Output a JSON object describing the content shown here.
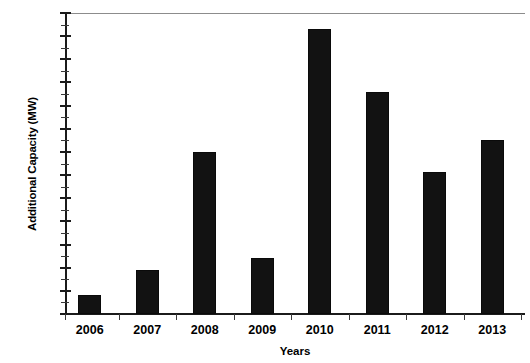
{
  "chart_data": {
    "type": "bar",
    "title": "",
    "subtitle": "",
    "xlabel": "Years",
    "ylabel": "Additional Capacity (MW)",
    "categories": [
      "2006",
      "2007",
      "2008",
      "2009",
      "2010",
      "2011",
      "2012",
      "2013"
    ],
    "values": [
      40,
      95,
      350,
      120,
      615,
      480,
      307,
      375
    ],
    "series": [
      {
        "name": "Additional Capacity",
        "values": [
          40,
          95,
          350,
          120,
          615,
          480,
          307,
          375
        ],
        "color": "#121212"
      }
    ],
    "ylim": [
      0,
      650
    ],
    "y_major_step": 50,
    "y_minor_step": 25,
    "y_tick_labels": [
      "0",
      "50",
      "100",
      "150",
      "200",
      "250",
      "300",
      "350",
      "400",
      "450",
      "500",
      "550",
      "600",
      "650"
    ],
    "y_tick_values": [
      0,
      50,
      100,
      150,
      200,
      250,
      300,
      350,
      400,
      450,
      500,
      550,
      600,
      650
    ],
    "grid": "top-only",
    "legend": "none",
    "legend_position": "",
    "annotations": [],
    "bar_color": "#121212",
    "axis_color": "#1b1b1b",
    "background_color": "#ffffff"
  }
}
